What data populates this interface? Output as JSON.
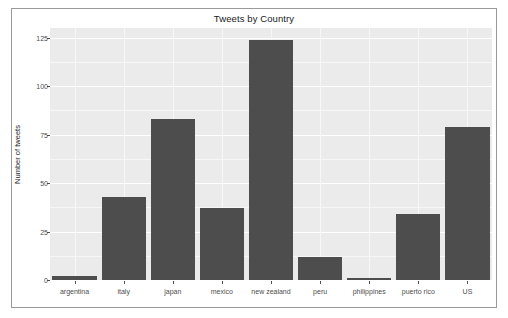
{
  "chart_data": {
    "type": "bar",
    "title": "Tweets by Country",
    "xlabel": "",
    "ylabel": "Number of tweets",
    "categories": [
      "argentina",
      "italy",
      "japan",
      "mexico",
      "new zealand",
      "peru",
      "philippines",
      "puerto rico",
      "US"
    ],
    "values": [
      2,
      43,
      83,
      37,
      124,
      12,
      1,
      34,
      79
    ],
    "ylim": [
      0,
      130
    ],
    "yticks": [
      0,
      25,
      50,
      75,
      100,
      125
    ],
    "ytick_labels": [
      "0",
      "25",
      "50",
      "75",
      "100",
      "125"
    ],
    "grid": true,
    "legend": null,
    "bar_color": "#4d4d4d",
    "panel_background": "#ebebeb",
    "figure_background": "#ffffff",
    "tick_text_color": "#4d4d4d",
    "title_color": "#1a1a1a"
  }
}
